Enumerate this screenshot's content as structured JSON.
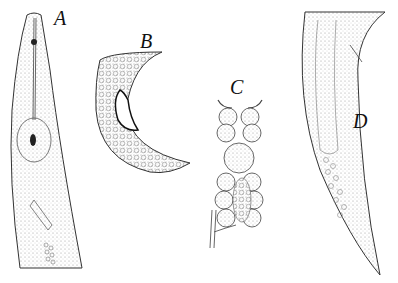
{
  "figure": {
    "panels": [
      {
        "id": "A",
        "label": "A",
        "description": "anterior end of nematode with stylet and median bulb"
      },
      {
        "id": "B",
        "label": "B",
        "description": "male posterior end with spicule"
      },
      {
        "id": "C",
        "label": "C",
        "description": "gland / cell cluster"
      },
      {
        "id": "D",
        "label": "D",
        "description": "female posterior tail"
      }
    ],
    "colors": {
      "ink": "#222222",
      "stipple": "#bdbdbd",
      "background": "#ffffff"
    }
  }
}
